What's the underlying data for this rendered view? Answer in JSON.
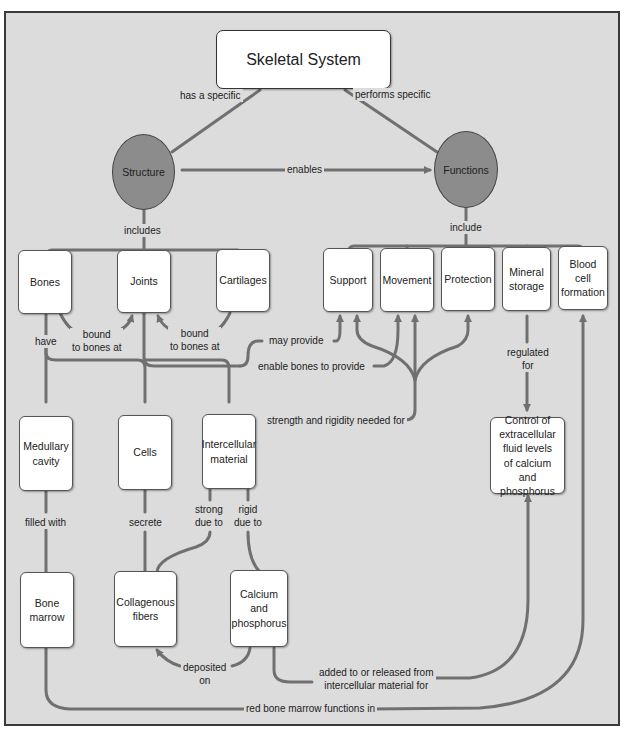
{
  "title": "Skeletal System",
  "concepts": {
    "structure": "Structure",
    "functions": "Functions",
    "bones": "Bones",
    "joints": "Joints",
    "cartilages": "Cartilages",
    "support": "Support",
    "movement": "Movement",
    "protection": "Protection",
    "mineral_storage": "Mineral\nstorage",
    "blood_cell_formation": "Blood\ncell\nformation",
    "medullary_cavity": "Medullary\ncavity",
    "cells": "Cells",
    "intercellular_material": "Intercellular\nmaterial",
    "control": "Control of\nextracellular\nfluid levels\nof calcium\nand phosphorus",
    "bone_marrow": "Bone\nmarrow",
    "collagenous_fibers": "Collagenous\nfibers",
    "calcium_phosphorus": "Calcium\nand\nphosphorus"
  },
  "links": {
    "has_a_specific": "has a specific",
    "performs_specific": "performs specific",
    "enables": "enables",
    "includes": "includes",
    "include": "include",
    "bound_1": "bound\nto bones at",
    "bound_2": "bound\nto bones at",
    "have": "have",
    "may_provide": "may provide",
    "enable_bones_to_provide": "enable bones to provide",
    "regulated_for": "regulated\nfor",
    "strength_rigidity": "strength and rigidity needed for",
    "filled_with": "filled with",
    "secrete": "secrete",
    "strong_due_to": "strong\ndue to",
    "rigid_due_to": "rigid\ndue to",
    "deposited_on": "deposited\non",
    "added_released": "added to or released from\nintercellular material for",
    "red_marrow_functions": "red bone marrow functions in"
  },
  "colors": {
    "background": "#dcdcdc",
    "line": "#707070",
    "circle_fill": "#8c8c8c",
    "node_fill": "#ffffff"
  }
}
